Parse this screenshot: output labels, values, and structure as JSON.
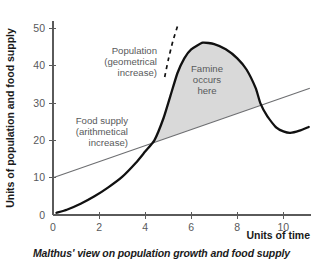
{
  "chart_data": {
    "type": "line",
    "title": "",
    "caption": "Malthus' view on population growth and food supply",
    "xlabel": "Units of time",
    "ylabel": "Units of population and food supply",
    "xlim": [
      0,
      11.2
    ],
    "ylim": [
      0,
      52
    ],
    "xticks": [
      "0",
      "2",
      "4",
      "6",
      "8",
      "10"
    ],
    "xtick_values": [
      0,
      2,
      4,
      6,
      8,
      10
    ],
    "yticks": [
      "0",
      "10",
      "20",
      "30",
      "40",
      "50"
    ],
    "ytick_values": [
      0,
      10,
      20,
      30,
      40,
      50
    ],
    "grid": false,
    "legend": "none",
    "series": [
      {
        "name": "Population (geometrical increase)",
        "style": "solid-thick-black",
        "color": "#111111",
        "x": [
          0.15,
          0.6,
          1.2,
          1.8,
          2.4,
          3.0,
          3.6,
          4.0,
          4.4,
          4.8,
          5.1,
          5.4,
          5.7,
          6.0,
          6.5,
          7.0,
          7.5,
          8.0,
          8.4,
          8.8,
          9.0,
          9.3,
          9.7,
          10.0,
          10.3,
          10.7,
          11.1
        ],
        "y": [
          0.6,
          1.4,
          3.0,
          5.0,
          7.4,
          10.2,
          14.0,
          17.0,
          20.0,
          26.0,
          32.0,
          38.0,
          42.0,
          44.4,
          46.2,
          45.8,
          44.4,
          42.0,
          39.0,
          34.0,
          30.0,
          26.5,
          23.4,
          22.4,
          22.0,
          22.6,
          23.6
        ]
      },
      {
        "name": "Population projection (dashed)",
        "style": "dashed-black",
        "color": "#111111",
        "x": [
          4.85,
          5.0,
          5.2,
          5.45
        ],
        "y": [
          37.0,
          41.5,
          46.5,
          51.5
        ]
      },
      {
        "name": "Food supply (arithmetical increase)",
        "style": "solid-thin-gray",
        "color": "#6d6e71",
        "x": [
          0,
          11.15
        ],
        "y": [
          10,
          34.0
        ]
      }
    ],
    "shaded_regions": [
      {
        "name": "famine-region",
        "label": "Famine occurs here",
        "color": "#d9d9d9",
        "x_start": 4.4,
        "x_end": 9.0
      }
    ],
    "annotations": [
      {
        "name": "population-annotation",
        "lines": [
          "Population",
          "(geometrical",
          "increase)"
        ],
        "align": "right"
      },
      {
        "name": "famine-annotation",
        "lines": [
          "Famine",
          "occurs",
          "here"
        ],
        "align": "center"
      },
      {
        "name": "food-supply-annotation",
        "lines": [
          "Food supply",
          "(arithmetical",
          "increase)"
        ],
        "align": "right"
      }
    ]
  }
}
